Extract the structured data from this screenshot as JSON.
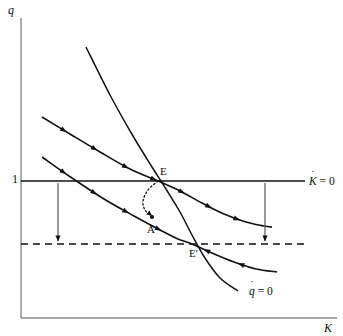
{
  "figure": {
    "type": "phase-diagram"
  },
  "axes": {
    "y_label": "q",
    "x_label": "K",
    "y_axis": {
      "x": 21,
      "y_top": 18,
      "y_bottom": 318
    },
    "x_axis": {
      "y": 318,
      "x_left": 21,
      "x_right": 337
    },
    "frame_color": "#8a8a8a"
  },
  "ticks": {
    "y": [
      {
        "label": "1",
        "value": 1,
        "x": 14,
        "y": 181
      }
    ]
  },
  "curves": {
    "k_dot_zero": {
      "label_base": "K",
      "label_dot": "˙",
      "label_rest": " = 0",
      "label_text": "K̇ = 0",
      "y": 181,
      "x_start": 21,
      "x_end": 305,
      "style": "solid",
      "color": "#111111",
      "label_x": 309,
      "label_y": 176
    },
    "q_dot_zero": {
      "label_base": "q",
      "label_dot": "˙",
      "label_rest": " = 0",
      "label_text": "q̇ = 0",
      "style": "solid",
      "color": "#111111",
      "label_x": 249,
      "label_y": 286,
      "points": [
        [
          86,
          47
        ],
        [
          110,
          95
        ],
        [
          133,
          136
        ],
        [
          152,
          167
        ],
        [
          166,
          189
        ],
        [
          180,
          212
        ],
        [
          192,
          235
        ],
        [
          205,
          258
        ],
        [
          220,
          278
        ],
        [
          238,
          291
        ]
      ]
    },
    "new_k_dot_zero_dashed": {
      "y": 244,
      "x_start": 21,
      "x_end": 307,
      "style": "dashed",
      "color": "#111111"
    },
    "saddle_path_old": {
      "name": "saddle-path-through-E",
      "style": "solid",
      "color": "#111111",
      "points": [
        [
          42,
          117
        ],
        [
          70,
          134
        ],
        [
          100,
          152
        ],
        [
          130,
          169
        ],
        [
          158,
          181
        ],
        [
          180,
          191
        ],
        [
          202,
          203
        ],
        [
          224,
          214
        ],
        [
          246,
          222
        ],
        [
          264,
          226
        ],
        [
          272,
          227
        ]
      ]
    },
    "saddle_path_new": {
      "name": "saddle-path-through-E-prime",
      "style": "solid",
      "color": "#111111",
      "points": [
        [
          42,
          157
        ],
        [
          72,
          178
        ],
        [
          104,
          199
        ],
        [
          134,
          216
        ],
        [
          160,
          230
        ],
        [
          178,
          239
        ],
        [
          192,
          244
        ],
        [
          212,
          253
        ],
        [
          234,
          262
        ],
        [
          256,
          269
        ],
        [
          277,
          272
        ]
      ]
    }
  },
  "points": [
    {
      "id": "E",
      "label": "E",
      "x": 158,
      "y": 181,
      "label_x": 160,
      "label_y": 166
    },
    {
      "id": "A",
      "label": "A",
      "x": 152,
      "y": 217,
      "label_x": 147,
      "label_y": 224
    },
    {
      "id": "Ep",
      "label": "E′",
      "x": 192,
      "y": 244,
      "label_x": 189,
      "label_y": 248
    }
  ],
  "jump_path": {
    "name": "initial-jump-E-to-A",
    "style": "dotted",
    "color": "#111111",
    "from": "E",
    "to": "A",
    "points": [
      [
        158,
        181
      ],
      [
        148,
        190
      ],
      [
        143,
        201
      ],
      [
        145,
        210
      ],
      [
        152,
        216
      ]
    ]
  },
  "shift_arrows": [
    {
      "name": "left-shift-arrow",
      "x": 58,
      "y_from": 183,
      "y_to": 241
    },
    {
      "name": "right-shift-arrow",
      "x": 265,
      "y_from": 183,
      "y_to": 241
    }
  ],
  "direction_markers": {
    "description": "small filled arrowheads showing motion along saddle paths",
    "count_old_left": 4,
    "count_old_right": 4,
    "count_new_left": 4,
    "count_new_right": 3
  },
  "colors": {
    "line": "#111111",
    "frame": "#8a8a8a",
    "background": "#ffffff"
  }
}
